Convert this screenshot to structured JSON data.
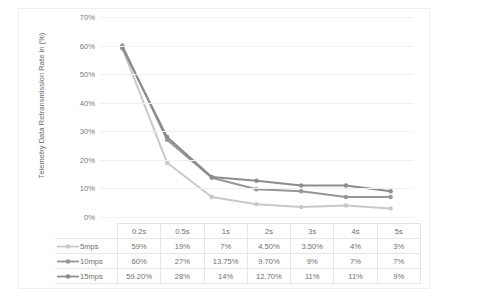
{
  "chart_data": {
    "type": "line",
    "title": "",
    "xlabel": "",
    "ylabel": "Telemetry Data Retransmission Rate in (%)",
    "categories": [
      "0.2s",
      "0.5s",
      "1s",
      "2s",
      "3s",
      "4s",
      "5s"
    ],
    "ylim": [
      0,
      70
    ],
    "ytick_labels": [
      "0%",
      "10%",
      "20%",
      "30%",
      "40%",
      "50%",
      "60%",
      "70%"
    ],
    "ytick_values": [
      0,
      10,
      20,
      30,
      40,
      50,
      60,
      70
    ],
    "grid": true,
    "legend_position": "table-left",
    "series": [
      {
        "name": "5mps",
        "color": "#c9c9c9",
        "values": [
          59,
          19,
          7,
          4.5,
          3.5,
          4,
          3
        ],
        "labels": [
          "59%",
          "19%",
          "7%",
          "4.50%",
          "3.50%",
          "4%",
          "3%"
        ]
      },
      {
        "name": "10mps",
        "color": "#969696",
        "values": [
          60,
          27,
          13.75,
          9.7,
          9,
          7,
          7
        ],
        "labels": [
          "60%",
          "27%",
          "13.75%",
          "9.70%",
          "9%",
          "7%",
          "7%"
        ]
      },
      {
        "name": "15mps",
        "color": "#8c8c8c",
        "values": [
          59.2,
          28,
          14,
          12.7,
          11,
          11,
          9
        ],
        "labels": [
          "59.20%",
          "28%",
          "14%",
          "12.70%",
          "11%",
          "11%",
          "9%"
        ]
      }
    ]
  },
  "table": {
    "header_blank": "",
    "columns": [
      "0.2s",
      "0.5s",
      "1s",
      "2s",
      "3s",
      "4s",
      "5s"
    ],
    "rows": [
      {
        "label": "5mps",
        "cells": [
          "59%",
          "19%",
          "7%",
          "4.50%",
          "3.50%",
          "4%",
          "3%"
        ]
      },
      {
        "label": "10mps",
        "cells": [
          "60%",
          "27%",
          "13.75%",
          "9.70%",
          "9%",
          "7%",
          "7%"
        ]
      },
      {
        "label": "15mps",
        "cells": [
          "59.20%",
          "28%",
          "14%",
          "12.70%",
          "11%",
          "11%",
          "9%"
        ]
      }
    ]
  }
}
